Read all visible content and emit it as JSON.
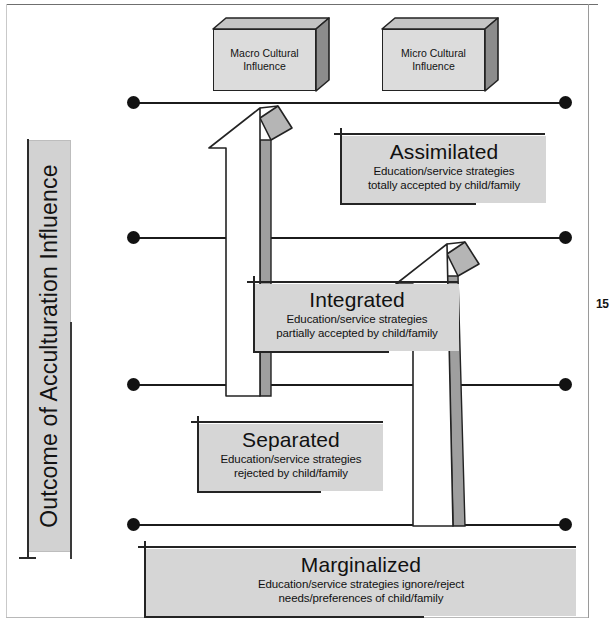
{
  "page": {
    "number": "15"
  },
  "axis": {
    "caption": "Outcome of Acculturation Influence"
  },
  "influences": [
    {
      "id": "macro",
      "line1": "Macro Cultural",
      "line2": "Influence"
    },
    {
      "id": "micro",
      "line1": "Micro Cultural",
      "line2": "Influence"
    }
  ],
  "outcomes": [
    {
      "id": "assimilated",
      "title": "Assimilated",
      "sub_line1": "Education/service strategies",
      "sub_line2": "totally accepted by child/family"
    },
    {
      "id": "integrated",
      "title": "Integrated",
      "sub_line1": "Education/service strategies",
      "sub_line2": "partially accepted by child/family"
    },
    {
      "id": "separated",
      "title": "Separated",
      "sub_line1": "Education/service strategies",
      "sub_line2": "rejected by child/family"
    },
    {
      "id": "marginalized",
      "title": "Marginalized",
      "sub_line1": "Education/service strategies ignore/reject",
      "sub_line2": "needs/preferences of child/family"
    }
  ],
  "colors": {
    "box_fill": "#d6d6d6",
    "cuboid_fill": "#dcdcdc",
    "cuboid_side": "#8c8c8c",
    "arrow_fill": "#ffffff",
    "arrow_shadow": "#a8a8a8",
    "outline": "#232323",
    "level_line": "#1b1b1b"
  },
  "levels": [
    {
      "id": "level-1",
      "y": 103
    },
    {
      "id": "level-2",
      "y": 238
    },
    {
      "id": "level-3",
      "y": 385
    },
    {
      "id": "level-4",
      "y": 525
    }
  ],
  "arrows": [
    {
      "id": "macro-arrow",
      "from_level": "level-3",
      "to_level": "level-1"
    },
    {
      "id": "micro-arrow",
      "from_level": "level-4",
      "to_level": "level-2"
    }
  ]
}
